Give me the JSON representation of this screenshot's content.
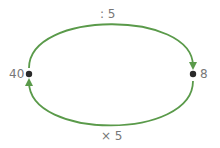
{
  "diagram": {
    "nodes": [
      {
        "id": "left",
        "label": "40"
      },
      {
        "id": "right",
        "label": "8"
      }
    ],
    "edges": [
      {
        "from": "left",
        "to": "right",
        "label": ": 5",
        "position": "top"
      },
      {
        "from": "right",
        "to": "left",
        "label": "× 5",
        "position": "bottom"
      }
    ],
    "colors": {
      "arrow": "#5a9a4a",
      "dot": "#2a2a2a",
      "text": "#777777"
    }
  }
}
